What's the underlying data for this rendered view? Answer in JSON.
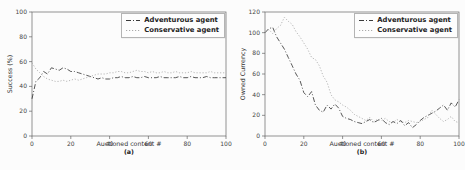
{
  "figure": {
    "background": "#fcfcfc",
    "frame_color": "#666666"
  },
  "chart_data": [
    {
      "type": "line",
      "panel_label": "(a)",
      "xlabel": "Auctioned content #",
      "ylabel": "Success (%)",
      "xlim": [
        0,
        100
      ],
      "ylim": [
        0,
        100
      ],
      "xticks": [
        0,
        20,
        40,
        60,
        80,
        100
      ],
      "yticks": [
        0,
        20,
        40,
        60,
        80,
        100
      ],
      "grid": false,
      "legend_position": "upper right",
      "x": [
        0,
        2,
        4,
        6,
        8,
        10,
        12,
        14,
        16,
        18,
        20,
        22,
        24,
        26,
        28,
        30,
        32,
        34,
        36,
        38,
        40,
        42,
        44,
        46,
        48,
        50,
        52,
        54,
        56,
        58,
        60,
        62,
        64,
        66,
        68,
        70,
        72,
        74,
        76,
        78,
        80,
        82,
        84,
        86,
        88,
        90,
        92,
        94,
        96,
        98,
        100
      ],
      "series": [
        {
          "name": "Adventurous agent",
          "line_style": "dashdot",
          "color": "#3a3a3a",
          "values": [
            30,
            44,
            47,
            52,
            50,
            55,
            54,
            53,
            55,
            54,
            52,
            52,
            51,
            50,
            49,
            48,
            47,
            46,
            47,
            46,
            46,
            47,
            47,
            48,
            47,
            47,
            48,
            47,
            47,
            48,
            47,
            47,
            47,
            48,
            47,
            47,
            47,
            47,
            48,
            47,
            47,
            48,
            47,
            47,
            47,
            48,
            47,
            47,
            47,
            47,
            47
          ]
        },
        {
          "name": "Conservative agent",
          "line_style": "dotted",
          "color": "#aaaaaa",
          "values": [
            59,
            54,
            51,
            48,
            46,
            45,
            44,
            44,
            45,
            44,
            45,
            46,
            45,
            46,
            47,
            48,
            49,
            50,
            50,
            50,
            51,
            51,
            52,
            52,
            51,
            51,
            52,
            53,
            52,
            52,
            51,
            52,
            51,
            51,
            52,
            51,
            51,
            52,
            51,
            51,
            51,
            52,
            51,
            51,
            51,
            51,
            52,
            51,
            51,
            51,
            51
          ]
        }
      ]
    },
    {
      "type": "line",
      "panel_label": "(b)",
      "xlabel": "Auctioned content #",
      "ylabel": "Owned Currency",
      "xlim": [
        0,
        100
      ],
      "ylim": [
        0,
        120
      ],
      "xticks": [
        0,
        20,
        40,
        60,
        80,
        100
      ],
      "yticks": [
        0,
        20,
        40,
        60,
        80,
        100,
        120
      ],
      "grid": false,
      "legend_position": "upper right",
      "x": [
        0,
        2,
        4,
        6,
        8,
        10,
        12,
        14,
        16,
        18,
        20,
        22,
        24,
        26,
        28,
        30,
        32,
        34,
        36,
        38,
        40,
        42,
        44,
        46,
        48,
        50,
        52,
        54,
        56,
        58,
        60,
        62,
        64,
        66,
        68,
        70,
        72,
        74,
        76,
        78,
        80,
        82,
        84,
        86,
        88,
        90,
        92,
        94,
        96,
        98,
        100
      ],
      "series": [
        {
          "name": "Adventurous agent",
          "line_style": "dashdot",
          "color": "#3a3a3a",
          "values": [
            100,
            104,
            105,
            96,
            90,
            84,
            76,
            68,
            60,
            54,
            42,
            38,
            43,
            30,
            25,
            23,
            30,
            26,
            31,
            27,
            19,
            17,
            16,
            14,
            13,
            12,
            14,
            16,
            13,
            15,
            17,
            13,
            11,
            14,
            12,
            15,
            10,
            13,
            8,
            11,
            15,
            18,
            20,
            22,
            24,
            27,
            30,
            25,
            32,
            28,
            35
          ]
        },
        {
          "name": "Conservative agent",
          "line_style": "dotted",
          "color": "#aaaaaa",
          "values": [
            101,
            103,
            99,
            104,
            107,
            115,
            111,
            108,
            101,
            96,
            90,
            84,
            76,
            74,
            68,
            58,
            52,
            40,
            35,
            33,
            30,
            28,
            25,
            21,
            19,
            17,
            15,
            18,
            14,
            16,
            15,
            17,
            14,
            13,
            16,
            14,
            13,
            15,
            14,
            13,
            14,
            16,
            18,
            25,
            21,
            17,
            14,
            16,
            19,
            14,
            13
          ]
        }
      ]
    }
  ]
}
